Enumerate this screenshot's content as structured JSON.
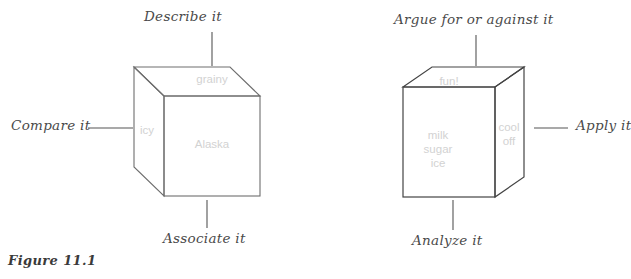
{
  "figure": {
    "caption": "Figure 11.1"
  },
  "colors": {
    "stroke": "#6e6e6e",
    "connector": "#555555",
    "face_text": "#d2d2d2",
    "label_text": "#4a4a4a",
    "background": "#ffffff"
  },
  "cubes": [
    {
      "id": "cube-left",
      "orientation": "side-face-left",
      "faces": {
        "top": "grainy",
        "left": "icy",
        "front": "Alaska"
      },
      "prompts": {
        "top": "Describe it",
        "left": "Compare it",
        "bottom": "Associate it"
      }
    },
    {
      "id": "cube-right",
      "orientation": "side-face-right",
      "faces": {
        "top": "fun!",
        "front_line1": "milk",
        "front_line2": "sugar",
        "front_line3": "ice",
        "right_line1": "cool",
        "right_line2": "off"
      },
      "prompts": {
        "top": "Argue for or against it",
        "right": "Apply it",
        "bottom": "Analyze it"
      }
    }
  ]
}
